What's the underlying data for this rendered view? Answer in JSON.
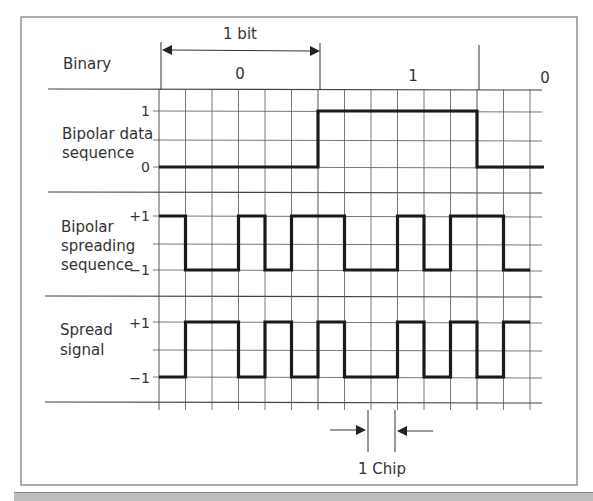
{
  "labels": {
    "binary": "Binary",
    "data_line1": "Bipolar data",
    "data_line2": "sequence",
    "spreading_line1": "Bipolar",
    "spreading_line2": "spreading",
    "spreading_line3": "sequence",
    "spread_line1": "Spread",
    "spread_line2": "signal",
    "bit_marker": "1 bit",
    "chip_marker": "1 Chip"
  },
  "ticks": {
    "data_high": "1",
    "data_low": "0",
    "spreading_high": "+1",
    "spreading_low": "−1",
    "spread_high": "+1",
    "spread_low": "−1"
  },
  "binary_bits": [
    "0",
    "1",
    "0"
  ],
  "chips_per_bit": 6,
  "total_chips": 14,
  "data_sequence": [
    0,
    1,
    0
  ],
  "spreading_sequence": [
    1,
    -1,
    -1,
    1,
    -1,
    1,
    1,
    -1,
    -1,
    1,
    -1,
    1,
    1,
    -1
  ],
  "spread_signal": [
    -1,
    1,
    1,
    -1,
    1,
    -1,
    1,
    -1,
    -1,
    1,
    -1,
    1,
    -1,
    1
  ],
  "colors": {
    "signal": "#1a1a1a",
    "grid": "#555555",
    "text": "#333333"
  }
}
